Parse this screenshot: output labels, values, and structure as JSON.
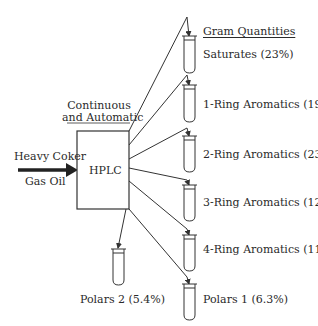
{
  "header": {
    "quantities_title": "Gram Quantities",
    "process_note_line1": "Continuous",
    "process_note_line2": "and Automatic"
  },
  "input": {
    "line1": "Heavy Coker",
    "line2": "Gas Oil"
  },
  "process": {
    "label": "HPLC"
  },
  "fractions": [
    {
      "name": "Saturates",
      "percent": "23%",
      "label": "Saturates (23%)"
    },
    {
      "name": "1-Ring Aromatics",
      "percent": "19%",
      "label": "1-Ring Aromatics (19%)"
    },
    {
      "name": "2-Ring Aromatics",
      "percent": "23%",
      "label": "2-Ring Aromatics (23%)"
    },
    {
      "name": "3-Ring Aromatics",
      "percent": "12%",
      "label": "3-Ring Aromatics (12%)"
    },
    {
      "name": "4-Ring Aromatics",
      "percent": "11%",
      "label": "4-Ring Aromatics (11%)"
    },
    {
      "name": "Polars 1",
      "percent": "6.3%",
      "label": "Polars 1 (6.3%)"
    }
  ],
  "side_fraction": {
    "name": "Polars 2",
    "percent": "5.4%",
    "label": "Polars 2 (5.4%)"
  },
  "colors": {
    "line": "#333333",
    "text": "#2a2a2a",
    "background": "#ffffff"
  }
}
